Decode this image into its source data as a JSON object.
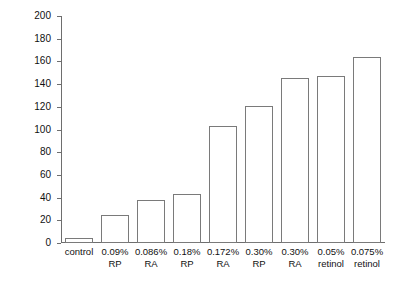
{
  "chart_data": {
    "type": "bar",
    "title": "",
    "xlabel": "",
    "ylabel": "expert grader cumulative irritation scores",
    "ylim": [
      0,
      200
    ],
    "ytick_step": 20,
    "yticks": [
      200,
      180,
      160,
      140,
      120,
      100,
      80,
      60,
      40,
      20,
      0
    ],
    "grid": false,
    "legend": null,
    "categories": [
      "control",
      "0.09% RP",
      "0.086% RA",
      "0.18% RP",
      "0.172% RA",
      "0.30% RP",
      "0.30% RA",
      "0.05% retinol",
      "0.075% retinol"
    ],
    "category_lines": [
      [
        "control",
        ""
      ],
      [
        "0.09%",
        "RP"
      ],
      [
        "0.086%",
        "RA"
      ],
      [
        "0.18%",
        "RP"
      ],
      [
        "0.172%",
        "RA"
      ],
      [
        "0.30%",
        "RP"
      ],
      [
        "0.30%",
        "RA"
      ],
      [
        "0.05%",
        "retinol"
      ],
      [
        "0.075%",
        "retinol"
      ]
    ],
    "values": [
      4,
      25,
      38,
      43,
      103,
      121,
      145,
      147,
      164
    ],
    "bar_fill": "#ffffff",
    "bar_edge": "#7a7a7a",
    "axis_color": "#6e6e6e",
    "background": "#ffffff"
  }
}
